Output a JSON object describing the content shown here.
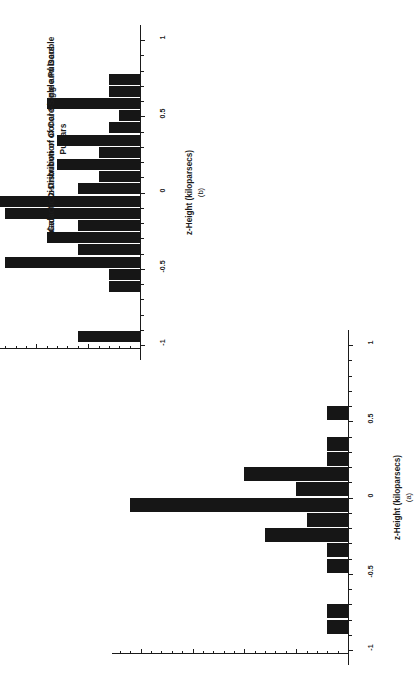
{
  "figure": {
    "background": "#ffffff",
    "ink": "#1b1b1b",
    "bar_color": "#161616"
  },
  "panels": [
    {
      "id": "b",
      "caption": "(b)",
      "title": "Galactic z-Distribution of Conal Single and Double Pulsars",
      "axis_title": "z-Height (kiloparsecs)",
      "tick_labels": [
        "-1",
        "-0.5",
        "0",
        "0.5",
        "1"
      ]
    },
    {
      "id": "a",
      "caption": "(a)",
      "title": "Galactic z-Distribution of Core-SIngle Pulsars",
      "axis_title": "z-Height (kiloparsecs)",
      "tick_labels": [
        "-1",
        "-0.5",
        "0",
        "0.5",
        "1"
      ]
    }
  ],
  "chart_data": [
    {
      "type": "bar",
      "id": "a",
      "title": "Galactic z-Distribution of Core-SIngle Pulsars",
      "caption": "(a)",
      "orientation": "horizontal",
      "xlabel": "z-Height (kiloparsecs)",
      "ylabel": "Number of Pulsars",
      "xlim": [
        -1.1,
        1.1
      ],
      "xticks": [
        -1,
        -0.5,
        0,
        0.5,
        1
      ],
      "xtick_labels": [
        "-1",
        "-0.5",
        "0",
        "0.5",
        "1"
      ],
      "ylim": [
        0,
        22
      ],
      "grid": false,
      "legend": false,
      "bin_width": 0.1,
      "categories": [
        -0.85,
        -0.75,
        -0.45,
        -0.35,
        -0.25,
        -0.15,
        -0.05,
        0.05,
        0.15,
        0.25,
        0.35,
        0.55
      ],
      "values": [
        2,
        2,
        2,
        2,
        8,
        4,
        21,
        5,
        10,
        2,
        2,
        2
      ]
    },
    {
      "type": "bar",
      "id": "b",
      "title": "Galactic z-Distribution of Conal Single and Double Pulsars",
      "caption": "(b)",
      "orientation": "horizontal",
      "xlabel": "z-Height (kiloparsecs)",
      "ylabel": "Number of Pulsars",
      "xlim": [
        -1.1,
        1.1
      ],
      "xticks": [
        -1,
        -0.5,
        0,
        0.5,
        1
      ],
      "xtick_labels": [
        "-1",
        "-0.5",
        "0",
        "0.5",
        "1"
      ],
      "ylim": [
        0,
        22
      ],
      "grid": false,
      "legend": false,
      "bin_width": 0.08,
      "categories": [
        -0.95,
        -0.62,
        -0.54,
        -0.46,
        -0.38,
        -0.3,
        -0.22,
        -0.14,
        -0.06,
        0.02,
        0.1,
        0.18,
        0.26,
        0.34,
        0.42,
        0.5,
        0.58,
        0.66,
        0.74
      ],
      "values": [
        6,
        3,
        3,
        13,
        6,
        9,
        6,
        13,
        20,
        6,
        4,
        8,
        4,
        8,
        3,
        2,
        9,
        3,
        3
      ]
    }
  ]
}
